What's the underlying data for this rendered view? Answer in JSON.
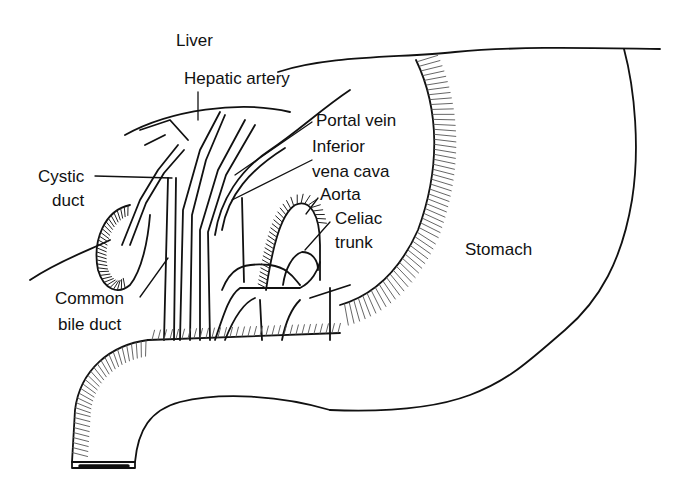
{
  "figure": {
    "colors": {
      "ink": "#111111",
      "background": "#ffffff"
    }
  },
  "labels": {
    "liver": "Liver",
    "hepatic_artery": "Hepatic artery",
    "portal_vein": "Portal vein",
    "ivc_line1": "Inferior",
    "ivc_line2": "vena cava",
    "aorta": "Aorta",
    "celiac_line1": "Celiac",
    "celiac_line2": "trunk",
    "cystic_line1": "Cystic",
    "cystic_line2": "duct",
    "cbd_line1": "Common",
    "cbd_line2": "bile duct",
    "stomach": "Stomach"
  }
}
